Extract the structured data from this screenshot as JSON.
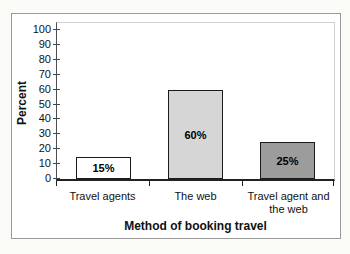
{
  "chart_data": {
    "type": "bar",
    "title": "",
    "categories": [
      "Travel agents",
      "The web",
      "Travel agent and the web"
    ],
    "values": [
      15,
      60,
      25
    ],
    "bar_labels": [
      "15%",
      "60%",
      "25%"
    ],
    "bar_colors": [
      "#ffffff",
      "#d6d6d6",
      "#9c9c9c"
    ],
    "xlabel": "Method of booking travel",
    "ylabel": "Percent",
    "ylim": [
      0,
      100
    ],
    "yticks": [
      0,
      10,
      20,
      30,
      40,
      50,
      60,
      70,
      80,
      90,
      100
    ],
    "grid": false,
    "legend": "none"
  }
}
